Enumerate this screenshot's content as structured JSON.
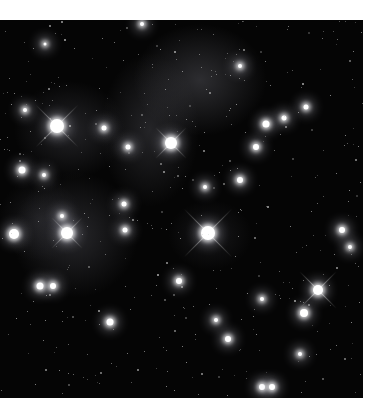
{
  "image": {
    "subject": "star cluster with reflection nebula",
    "background_color": "#050505",
    "star_color": "#ffffff"
  },
  "stars": [
    {
      "x": 57,
      "y": 126,
      "r": 7,
      "spikes": 30
    },
    {
      "x": 171,
      "y": 143,
      "r": 6,
      "spikes": 22
    },
    {
      "x": 208,
      "y": 233,
      "r": 7,
      "spikes": 34
    },
    {
      "x": 67,
      "y": 233,
      "r": 6,
      "spikes": 22
    },
    {
      "x": 14,
      "y": 234,
      "r": 5,
      "spikes": 0
    },
    {
      "x": 22,
      "y": 170,
      "r": 3.5,
      "spikes": 0
    },
    {
      "x": 318,
      "y": 290,
      "r": 5,
      "spikes": 26
    },
    {
      "x": 304,
      "y": 313,
      "r": 4,
      "spikes": 0
    },
    {
      "x": 40,
      "y": 286,
      "r": 3.5,
      "spikes": 0
    },
    {
      "x": 53,
      "y": 286,
      "r": 3,
      "spikes": 0
    },
    {
      "x": 266,
      "y": 124,
      "r": 3.5,
      "spikes": 0
    },
    {
      "x": 256,
      "y": 147,
      "r": 3,
      "spikes": 0
    },
    {
      "x": 284,
      "y": 118,
      "r": 2.5,
      "spikes": 0
    },
    {
      "x": 306,
      "y": 107,
      "r": 2.5,
      "spikes": 0
    },
    {
      "x": 240,
      "y": 180,
      "r": 3,
      "spikes": 0
    },
    {
      "x": 205,
      "y": 187,
      "r": 2,
      "spikes": 0
    },
    {
      "x": 342,
      "y": 230,
      "r": 3,
      "spikes": 0
    },
    {
      "x": 350,
      "y": 247,
      "r": 2,
      "spikes": 0
    },
    {
      "x": 124,
      "y": 204,
      "r": 2.5,
      "spikes": 0
    },
    {
      "x": 125,
      "y": 230,
      "r": 2.5,
      "spikes": 0
    },
    {
      "x": 62,
      "y": 216,
      "r": 2,
      "spikes": 0
    },
    {
      "x": 110,
      "y": 322,
      "r": 3.5,
      "spikes": 0
    },
    {
      "x": 104,
      "y": 128,
      "r": 2.5,
      "spikes": 0
    },
    {
      "x": 128,
      "y": 147,
      "r": 2.5,
      "spikes": 0
    },
    {
      "x": 25,
      "y": 110,
      "r": 2,
      "spikes": 0
    },
    {
      "x": 44,
      "y": 175,
      "r": 2,
      "spikes": 0
    },
    {
      "x": 179,
      "y": 281,
      "r": 3,
      "spikes": 0
    },
    {
      "x": 228,
      "y": 339,
      "r": 3,
      "spikes": 0
    },
    {
      "x": 216,
      "y": 320,
      "r": 2,
      "spikes": 0
    },
    {
      "x": 262,
      "y": 387,
      "r": 3,
      "spikes": 0
    },
    {
      "x": 272,
      "y": 387,
      "r": 3,
      "spikes": 0
    },
    {
      "x": 262,
      "y": 299,
      "r": 2,
      "spikes": 0
    },
    {
      "x": 300,
      "y": 354,
      "r": 2,
      "spikes": 0
    },
    {
      "x": 240,
      "y": 66,
      "r": 2,
      "spikes": 0
    },
    {
      "x": 142,
      "y": 24,
      "r": 2,
      "spikes": 0
    },
    {
      "x": 45,
      "y": 44,
      "r": 1.5,
      "spikes": 0
    }
  ]
}
